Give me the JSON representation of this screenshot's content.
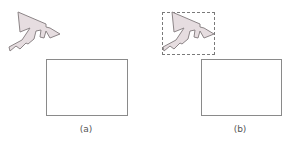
{
  "figure": {
    "panels": [
      {
        "id": "a",
        "label": "(a)",
        "has_bounding_box": false
      },
      {
        "id": "b",
        "label": "(b)",
        "has_bounding_box": true
      }
    ],
    "colors": {
      "shape_fill": "#e6dde0",
      "shape_stroke": "#8c8587",
      "rect_stroke": "#8a8a8a",
      "bbox_stroke": "#7a7a7a",
      "label_text": "#555555"
    }
  }
}
